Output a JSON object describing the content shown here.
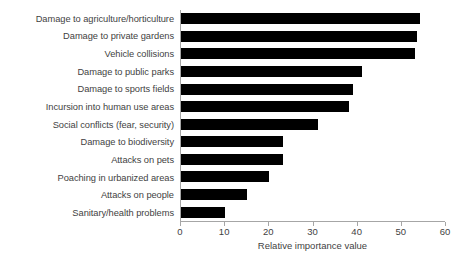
{
  "chart_data": {
    "type": "bar",
    "orientation": "horizontal",
    "title": "",
    "xlabel": "Relative importance value",
    "ylabel": "",
    "xlim": [
      0,
      60
    ],
    "xticks": [
      0,
      10,
      20,
      30,
      40,
      50,
      60
    ],
    "xtick_labels": [
      "0",
      "10",
      "20",
      "30",
      "40",
      "50",
      "60"
    ],
    "grid": false,
    "legend": false,
    "bar_color": "#000000",
    "axis_color": "#a6a6a6",
    "text_color": "#3f3f3f",
    "categories": [
      "Damage to agriculture/horticulture",
      "Damage to private gardens",
      "Vehicle collisions",
      "Damage to public parks",
      "Damage to sports fields",
      "Incursion into human use areas",
      "Social conflicts (fear, security)",
      "Damage to biodiversity",
      "Attacks on pets",
      "Poaching in urbanized areas",
      "Attacks on people",
      "Sanitary/health problems"
    ],
    "values": [
      54,
      53.5,
      53,
      41,
      39,
      38,
      31,
      23,
      23,
      20,
      15,
      10
    ]
  }
}
